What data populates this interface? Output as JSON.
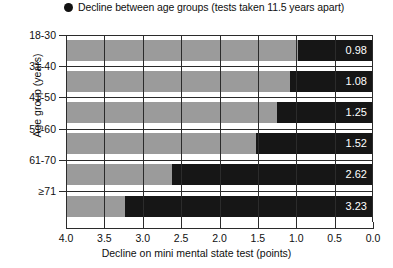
{
  "legend": {
    "marker": "filled-circle",
    "label": "Decline between age groups (tests taken 11.5 years apart)"
  },
  "axes": {
    "y_title": "Age group (years)",
    "x_title": "Decline on mini mental state test (points)"
  },
  "colors": {
    "bar_decline": "#161616",
    "bar_background": "#9b9b9b",
    "axis": "#2b2b2b",
    "value_text": "#ffffff",
    "page_background": "#ffffff"
  },
  "chart_data": {
    "type": "bar",
    "orientation": "horizontal",
    "title": "",
    "subtitle": "",
    "xlabel": "Decline on mini mental state test (points)",
    "ylabel": "Age group (years)",
    "xlim": [
      4.0,
      0.0
    ],
    "x_axis_reversed": true,
    "xticks": [
      4.0,
      3.5,
      3.0,
      2.5,
      2.0,
      1.5,
      1.0,
      0.5,
      0.0
    ],
    "xticklabels": [
      "4.0",
      "3.5",
      "3.0",
      "2.5",
      "2.0",
      "1.5",
      "1.0",
      "0.5",
      "0.0"
    ],
    "grid": true,
    "legend_position": "top-left",
    "legend": [
      "Decline between age groups (tests taken 11.5 years apart)"
    ],
    "categories": [
      "18-30",
      "31-40",
      "41-50",
      "51-60",
      "61-70",
      "≥71"
    ],
    "values": [
      0.98,
      1.08,
      1.25,
      1.52,
      2.62,
      3.23
    ],
    "value_labels": [
      "0.98",
      "1.08",
      "1.25",
      "1.52",
      "2.62",
      "3.23"
    ],
    "series": [
      {
        "name": "Decline between age groups (tests taken 11.5 years apart)",
        "values": [
          0.98,
          1.08,
          1.25,
          1.52,
          2.62,
          3.23
        ]
      }
    ]
  }
}
